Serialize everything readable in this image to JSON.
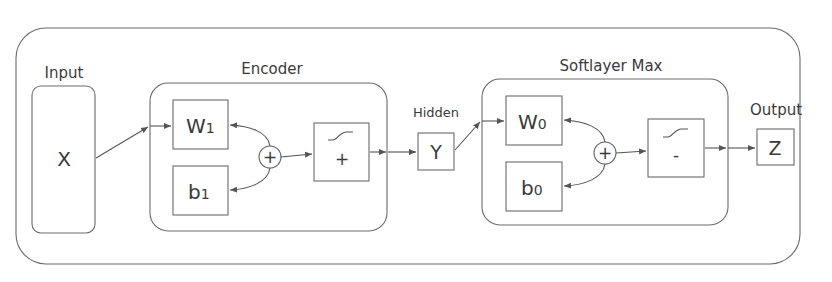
{
  "diagram": {
    "labels": {
      "input": "Input",
      "encoder": "Encoder",
      "hidden": "Hidden",
      "softlayer": "Softlayer Max",
      "output": "Output"
    },
    "nodes": {
      "x": "X",
      "w1_main": "W",
      "w1_sub": "1",
      "b1_main": "b",
      "b1_sub": "1",
      "sum1": "+",
      "act1_sign": "+",
      "y": "Y",
      "w0_main": "W",
      "w0_sub": "0",
      "b0_main": "b",
      "b0_sub": "0",
      "sum0": "+",
      "act0_sign": "-",
      "z": "Z"
    },
    "colors": {
      "stroke": "#6b6b6b",
      "text": "#3a3a3a",
      "background": "#ffffff"
    }
  }
}
